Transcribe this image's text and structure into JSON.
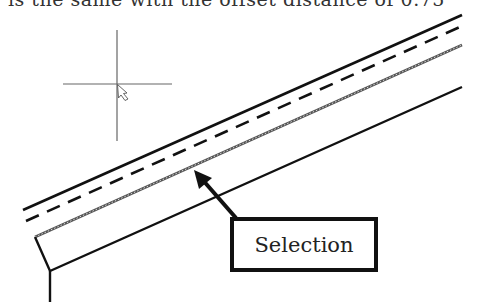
{
  "caption": {
    "text": "is the same with the offset distance of 0.75"
  },
  "drawing": {
    "crosshair": {
      "x": 117,
      "y": 84,
      "h_from": 63,
      "h_to": 172,
      "v_from": 30,
      "v_to": 141,
      "color": "#666666"
    },
    "lines": [
      {
        "name": "top-solid-line",
        "style": "solid",
        "x1": 23,
        "y1": 210,
        "x2": 462,
        "y2": 15
      },
      {
        "name": "offset-dashed-line",
        "style": "dashed",
        "x1": 26,
        "y1": 221,
        "x2": 462,
        "y2": 26
      },
      {
        "name": "selected-dotted-line",
        "style": "selected",
        "x1": 35,
        "y1": 237,
        "x2": 462,
        "y2": 45
      },
      {
        "name": "lower-solid-line",
        "style": "solid",
        "x1": 50,
        "y1": 271,
        "x2": 462,
        "y2": 87
      }
    ],
    "stroke_color": "#111111"
  },
  "callout": {
    "label": "Selection",
    "arrow_from": [
      235,
      217
    ],
    "arrow_to": [
      194,
      170
    ]
  }
}
